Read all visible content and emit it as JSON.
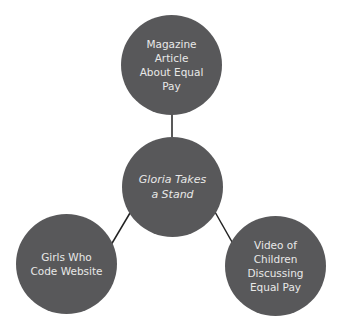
{
  "diagram": {
    "type": "hub-and-spoke",
    "colors": {
      "node_fill": "#58585a",
      "node_text": "#e8e8e8",
      "edge": "#222222",
      "background": "#ffffff"
    },
    "center": {
      "label_lines": [
        "Gloria Takes",
        "a Stand"
      ],
      "italic": true
    },
    "nodes": [
      {
        "id": "top",
        "label_lines": [
          "Magazine Article",
          "About Equal Pay"
        ]
      },
      {
        "id": "left",
        "label_lines": [
          "Girls Who",
          "Code Website"
        ]
      },
      {
        "id": "right",
        "label_lines": [
          "Video of",
          "Children",
          "Discussing",
          "Equal Pay"
        ]
      }
    ],
    "edges": [
      {
        "from": "center",
        "to": "top"
      },
      {
        "from": "center",
        "to": "left"
      },
      {
        "from": "center",
        "to": "right"
      }
    ]
  }
}
